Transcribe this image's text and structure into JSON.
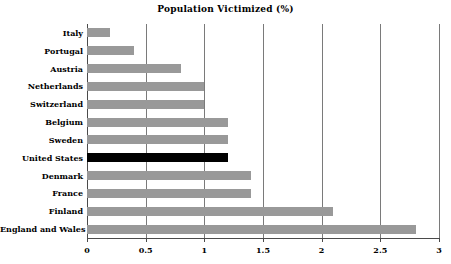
{
  "chart_data": {
    "type": "bar",
    "orientation": "horizontal",
    "title": "Population Victimized (%)",
    "xlabel": "",
    "ylabel": "",
    "xlim": [
      0,
      3
    ],
    "xticks": [
      "0",
      "0.5",
      "1",
      "1.5",
      "2",
      "2.5",
      "3"
    ],
    "xtick_values": [
      0,
      0.5,
      1,
      1.5,
      2,
      2.5,
      3
    ],
    "grid": "vertical",
    "legend": "none",
    "categories": [
      "Italy",
      "Portugal",
      "Austria",
      "Netherlands",
      "Switzerland",
      "Belgium",
      "Sweden",
      "United States",
      "Denmark",
      "France",
      "Finland",
      "England and Wales"
    ],
    "values": [
      0.2,
      0.4,
      0.8,
      1.0,
      1.0,
      1.2,
      1.2,
      1.2,
      1.4,
      1.4,
      2.1,
      2.8
    ],
    "highlight_category": "United States",
    "colors": {
      "bar": "#999999",
      "highlight_bar": "#000000",
      "gridline": "#7a7a7a",
      "axis": "#4a4a4a",
      "text": "#000000",
      "background": "#ffffff"
    }
  }
}
